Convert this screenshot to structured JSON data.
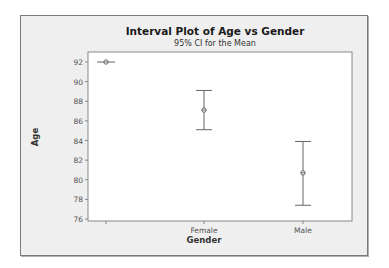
{
  "chart_data": {
    "type": "interval",
    "title": "Interval Plot of Age vs Gender",
    "subtitle": "95% CI for the Mean",
    "xlabel": "Gender",
    "ylabel": "Age",
    "categories": [
      "",
      "Female",
      "Male"
    ],
    "series": [
      {
        "name": "95% CI",
        "mean": [
          92.0,
          87.1,
          80.7
        ],
        "lower": [
          92.0,
          85.1,
          77.4
        ],
        "upper": [
          92.0,
          89.1,
          83.9
        ]
      }
    ],
    "yticks": [
      76,
      78,
      80,
      82,
      84,
      86,
      88,
      90,
      92
    ],
    "ylim": [
      75.8,
      93
    ],
    "grid": false,
    "colors": {
      "frame_bg": "#efefef",
      "plot_bg": "#ffffff",
      "line": "#666666"
    }
  }
}
